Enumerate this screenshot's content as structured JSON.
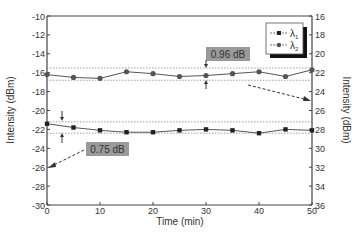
{
  "chart_data": {
    "type": "line",
    "title": "",
    "xlabel": "Time (min)",
    "ylabel": "Intensity (dBm)",
    "y2label": "Intensity (dBm)",
    "xlim": [
      0,
      50
    ],
    "ylim": [
      -30,
      -10
    ],
    "y2lim": [
      36,
      16
    ],
    "x_ticks": [
      0,
      10,
      20,
      30,
      40,
      50
    ],
    "y_ticks": [
      -10,
      -12,
      -14,
      -16,
      -18,
      -20,
      -22,
      -24,
      -26,
      -28,
      -30
    ],
    "y2_ticks": [
      16,
      18,
      20,
      22,
      24,
      26,
      28,
      30,
      32,
      34,
      36
    ],
    "grid": false,
    "legend_position": "upper right",
    "x": [
      0,
      5,
      10,
      15,
      20,
      25,
      30,
      35,
      40,
      45,
      50
    ],
    "series": [
      {
        "name": "λ1",
        "marker": "square",
        "axis": "left",
        "values": [
          -21.4,
          -21.8,
          -22.1,
          -22.3,
          -22.3,
          -22.1,
          -22.0,
          -22.1,
          -22.4,
          -22.0,
          -22.1
        ]
      },
      {
        "name": "λ2",
        "marker": "circle",
        "axis": "left",
        "values": [
          -16.2,
          -16.5,
          -16.6,
          -15.9,
          -16.1,
          -16.4,
          -16.3,
          -16.1,
          -15.9,
          -16.4,
          -15.7
        ]
      }
    ],
    "annotations": [
      {
        "text": "0.96 dB",
        "series": "λ2",
        "band": [
          -15.5,
          -16.8
        ]
      },
      {
        "text": "0.75 dB",
        "series": "λ1",
        "band": [
          -21.2,
          -22.4
        ]
      }
    ]
  },
  "legend": {
    "items": [
      "λ",
      "λ"
    ],
    "subs": [
      "1",
      "2"
    ]
  },
  "labels": {
    "ann1": "0.96 dB",
    "ann2": "0.75 dB"
  }
}
